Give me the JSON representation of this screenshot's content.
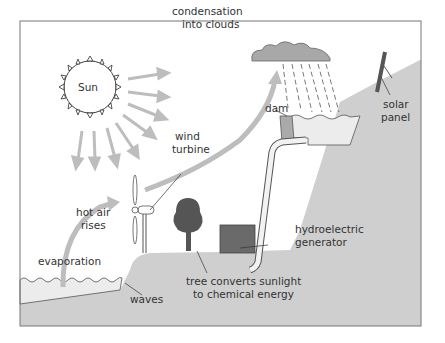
{
  "labels": {
    "sun": "Sun",
    "condensation_1": "condensation",
    "condensation_2": "into clouds",
    "wind_1": "wind",
    "wind_2": "turbine",
    "dam": "dam",
    "solar_1": "solar",
    "solar_2": "panel",
    "hot_air_1": "hot air",
    "hot_air_2": "rises",
    "evaporation": "evaporation",
    "waves": "waves",
    "hydro_1": "hydroelectric",
    "hydro_2": "generator",
    "tree_1": "tree converts sunlight",
    "tree_2": "to chemical energy"
  },
  "colors": {
    "land": "#cfcfcf",
    "water": "#ececec",
    "arrow": "#bdbdbd",
    "cloud": "#a8a8a8",
    "tree": "#555555",
    "generator": "#6a6a6a",
    "frame": "#777777",
    "text": "#333333"
  }
}
